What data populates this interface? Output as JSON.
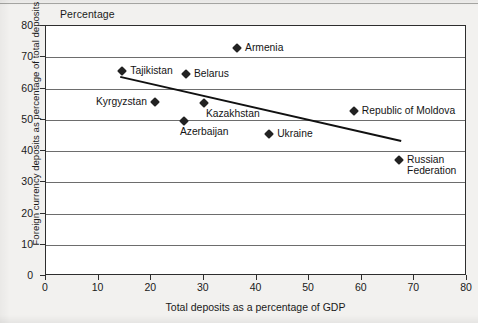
{
  "chart_data": {
    "type": "scatter",
    "title": "",
    "unit_label": "Percentage",
    "xlabel": "Total deposits as a percentage of GDP",
    "ylabel": "Foreign currency deposits as percentage of total deposits",
    "xlim": [
      0,
      80
    ],
    "ylim": [
      0,
      80
    ],
    "xticks": [
      0,
      10,
      20,
      30,
      40,
      50,
      60,
      70,
      80
    ],
    "yticks": [
      0,
      10,
      20,
      30,
      40,
      50,
      60,
      70,
      80
    ],
    "grid": "horizontal",
    "legend": "none",
    "marker_shape": "diamond",
    "marker_color": "#222222",
    "points": [
      {
        "label": "Tajikistan",
        "x": 14.5,
        "y": 65.5,
        "label_pos": "right"
      },
      {
        "label": "Belarus",
        "x": 26.6,
        "y": 64.5,
        "label_pos": "right"
      },
      {
        "label": "Armenia",
        "x": 36.3,
        "y": 73.0,
        "label_pos": "right"
      },
      {
        "label": "Kyrgyzstan",
        "x": 20.7,
        "y": 55.8,
        "label_pos": "left"
      },
      {
        "label": "Kazakhstan",
        "x": 30.0,
        "y": 55.5,
        "label_pos": "below-right"
      },
      {
        "label": "Azerbaijan",
        "x": 26.2,
        "y": 49.5,
        "label_pos": "below"
      },
      {
        "label": "Ukraine",
        "x": 42.4,
        "y": 45.5,
        "label_pos": "right"
      },
      {
        "label": "Republic of Moldova",
        "x": 58.5,
        "y": 52.8,
        "label_pos": "right"
      },
      {
        "label": "Russian Federation",
        "x": 67.1,
        "y": 37.2,
        "label_pos": "right"
      }
    ],
    "trendline": {
      "description": "linear fit, negative slope",
      "x_start": 14.1,
      "y_start": 63.7,
      "x_end": 67.5,
      "y_end": 43.2,
      "color": "#111111"
    }
  }
}
